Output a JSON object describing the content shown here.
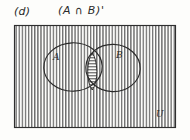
{
  "figure": {
    "part_label": "(d)",
    "expression_label": "(A ∩ B)'",
    "colors": {
      "ink": "#2a2a2a",
      "hatch": "#4a4a4a",
      "background": "#fdfdfb"
    }
  },
  "diagram": {
    "universe": {
      "label": "U",
      "shading": "vertical-hatch",
      "bounds": {
        "x": 14,
        "y": 25,
        "width": 162,
        "height": 103
      }
    },
    "sets": [
      {
        "label": "A",
        "cx": 73,
        "cy": 67,
        "r": 29,
        "label_x": 53,
        "label_y": 56
      },
      {
        "label": "B",
        "cx": 113,
        "cy": 68,
        "r": 27,
        "label_x": 117,
        "label_y": 54
      }
    ],
    "intersection": {
      "shading": "horizontal-hatch",
      "top_y": 53,
      "bottom_y": 90
    }
  }
}
